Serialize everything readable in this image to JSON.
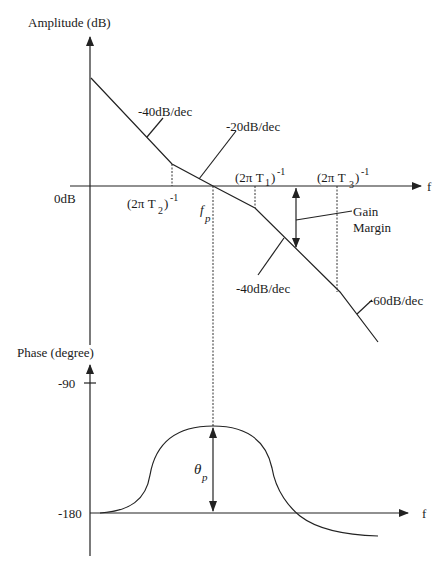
{
  "amplitude_plot": {
    "y_axis_label": "Amplitude (dB)",
    "x_axis_label": "f",
    "zero_label": "0dB",
    "slopes": {
      "first": "-40dB/dec",
      "second": "-20dB/dec",
      "third": "-40dB/dec",
      "fourth": "-60dB/dec"
    },
    "corner_labels": {
      "t2": "(2π T",
      "t2_sub": "2",
      "t1": "(2π T",
      "t1_sub": "1",
      "t3": "(2π T",
      "t3_sub": "3",
      "close": ")",
      "exp": "-1"
    },
    "crossover_label": "f",
    "crossover_sub": "p",
    "gain_margin_line1": "Gain",
    "gain_margin_line2": "Margin"
  },
  "phase_plot": {
    "y_axis_label": "Phase (degree)",
    "x_axis_label": "f",
    "tick_minus90": "-90",
    "tick_minus180": "-180",
    "phase_margin_label": "θ",
    "phase_margin_sub": "p"
  },
  "colors": {
    "line": "#222222",
    "background": "#ffffff"
  }
}
